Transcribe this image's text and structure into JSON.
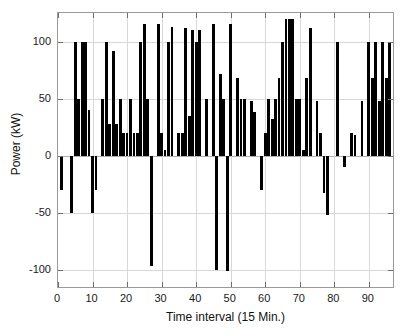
{
  "chart_data": {
    "type": "bar",
    "title": "",
    "xlabel": "Time interval (15 Min.)",
    "ylabel": "Power (kW)",
    "xlim": [
      0,
      97
    ],
    "ylim": [
      -115,
      125
    ],
    "xticks": [
      0,
      10,
      20,
      30,
      40,
      50,
      60,
      70,
      80,
      90
    ],
    "yticks": [
      -100,
      -50,
      0,
      50,
      100
    ],
    "xticklabels": [
      "0",
      "10",
      "20",
      "30",
      "40",
      "50",
      "60",
      "70",
      "80",
      "90"
    ],
    "yticklabels": [
      "-100",
      "-50",
      "0",
      "50",
      "100"
    ],
    "grid": true,
    "legend": null,
    "bar_color": "#000000",
    "categories": [
      1,
      2,
      3,
      4,
      5,
      6,
      7,
      8,
      9,
      10,
      11,
      12,
      13,
      14,
      15,
      16,
      17,
      18,
      19,
      20,
      21,
      22,
      23,
      24,
      25,
      26,
      27,
      28,
      29,
      30,
      31,
      32,
      33,
      34,
      35,
      36,
      37,
      38,
      39,
      40,
      41,
      42,
      43,
      44,
      45,
      46,
      47,
      48,
      49,
      50,
      51,
      52,
      53,
      54,
      55,
      56,
      57,
      58,
      59,
      60,
      61,
      62,
      63,
      64,
      65,
      66,
      67,
      68,
      69,
      70,
      71,
      72,
      73,
      74,
      75,
      76,
      77,
      78,
      79,
      80,
      81,
      82,
      83,
      84,
      85,
      86,
      87,
      88,
      89,
      90,
      91,
      92,
      93,
      94,
      95,
      96
    ],
    "values": [
      -30,
      0,
      0,
      -50,
      100,
      50,
      100,
      100,
      40,
      -50,
      -30,
      0,
      50,
      100,
      28,
      92,
      28,
      50,
      20,
      20,
      50,
      20,
      20,
      100,
      115,
      50,
      -97,
      0,
      115,
      20,
      5,
      100,
      113,
      0,
      20,
      20,
      112,
      35,
      110,
      100,
      110,
      0,
      50,
      0,
      115,
      -100,
      72,
      50,
      -101,
      115,
      0,
      68,
      50,
      50,
      0,
      48,
      38,
      0,
      -30,
      20,
      50,
      32,
      50,
      68,
      100,
      120,
      120,
      120,
      50,
      50,
      5,
      68,
      112,
      0,
      48,
      20,
      -33,
      -52,
      0,
      0,
      100,
      0,
      -10,
      0,
      20,
      18,
      0,
      48,
      0,
      100,
      68,
      100,
      48,
      100,
      68,
      100
    ]
  },
  "figure": {
    "background_color": "#ffffff",
    "axes_color": "#9a9a9a",
    "grid_color": "#d8d8d8"
  }
}
